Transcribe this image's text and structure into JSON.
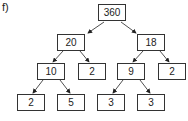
{
  "label": "f)",
  "tree": {
    "root": "360",
    "level1": [
      "20",
      "18"
    ],
    "level2": [
      "10",
      "2",
      "9",
      "2"
    ],
    "level3": [
      "2",
      "5",
      "3",
      "3"
    ]
  },
  "colors": {
    "border": "#333333",
    "arrow": "#222222"
  }
}
